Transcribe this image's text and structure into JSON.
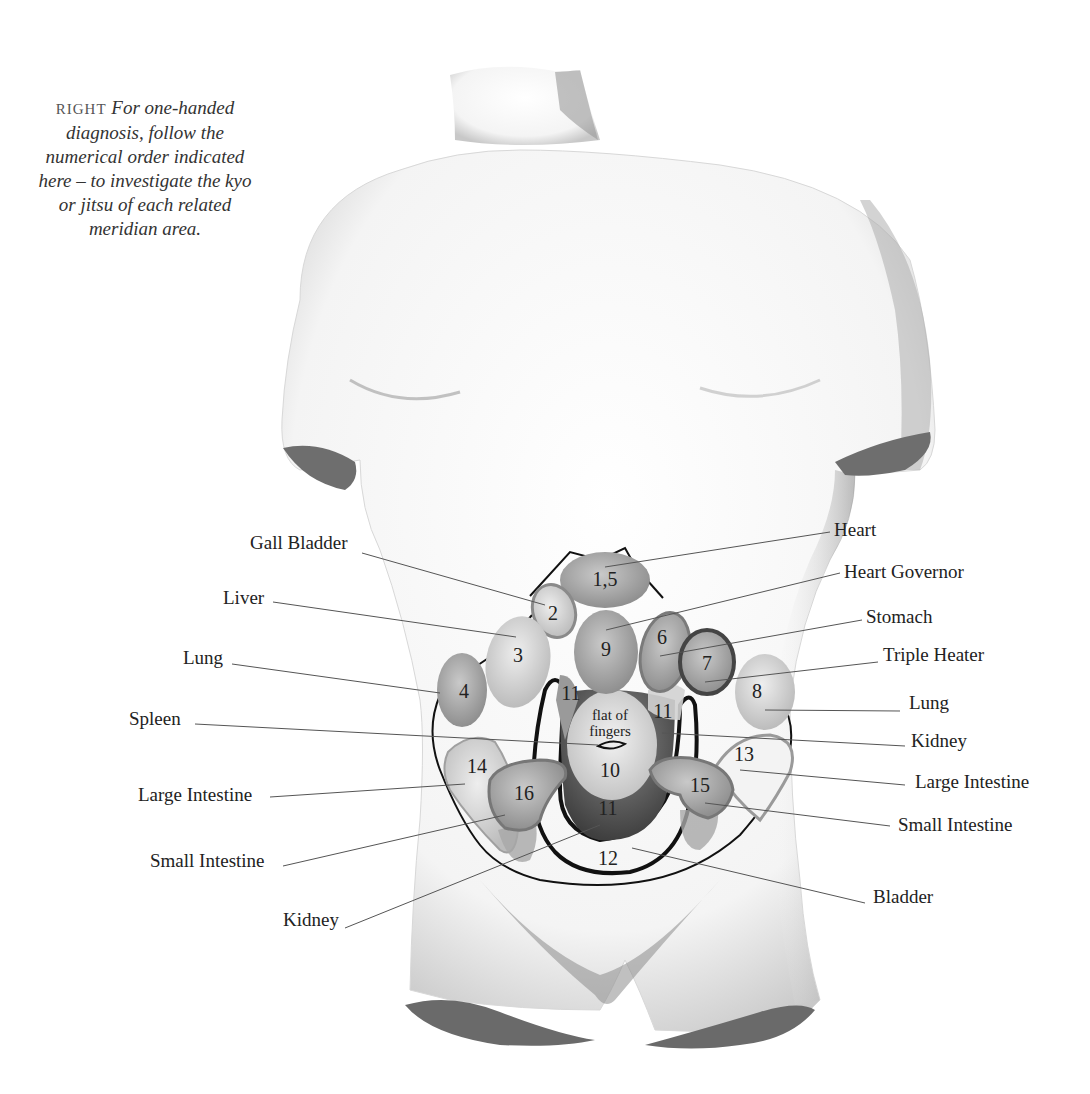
{
  "caption": {
    "lead": "RIGHT",
    "lines": [
      "For one-handed",
      "diagnosis, follow the",
      "numerical order indicated",
      "here – to investigate the kyo",
      "or jitsu of each related",
      "meridian area."
    ]
  },
  "zones": {
    "z1_5": "1,5",
    "z2": "2",
    "z3": "3",
    "z4": "4",
    "z6": "6",
    "z7": "7",
    "z8": "8",
    "z9": "9",
    "z10": "10",
    "z11_left": "11",
    "z11_right": "11",
    "z11_bottom": "11",
    "z12": "12",
    "z13": "13",
    "z14": "14",
    "z15": "15",
    "z16": "16",
    "flat_line1": "flat of",
    "flat_line2": "fingers"
  },
  "labels_left": {
    "gall_bladder": "Gall Bladder",
    "liver": "Liver",
    "lung": "Lung",
    "spleen": "Spleen",
    "large_intestine": "Large Intestine",
    "small_intestine": "Small Intestine",
    "kidney": "Kidney"
  },
  "labels_right": {
    "heart": "Heart",
    "heart_governor": "Heart Governor",
    "stomach": "Stomach",
    "triple_heater": "Triple Heater",
    "lung": "Lung",
    "kidney": "Kidney",
    "large_intestine": "Large Intestine",
    "small_intestine": "Small Intestine",
    "bladder": "Bladder"
  },
  "colors": {
    "torso": "#f7f7f7",
    "torso_shadow": "#bdbdbd",
    "cut_surface": "#6e6e6e",
    "zone_light": "#cfcfcf",
    "zone_mid": "#a9a9a9",
    "zone_dark": "#5c5c5c",
    "outline": "#111111",
    "leader": "#555555"
  }
}
